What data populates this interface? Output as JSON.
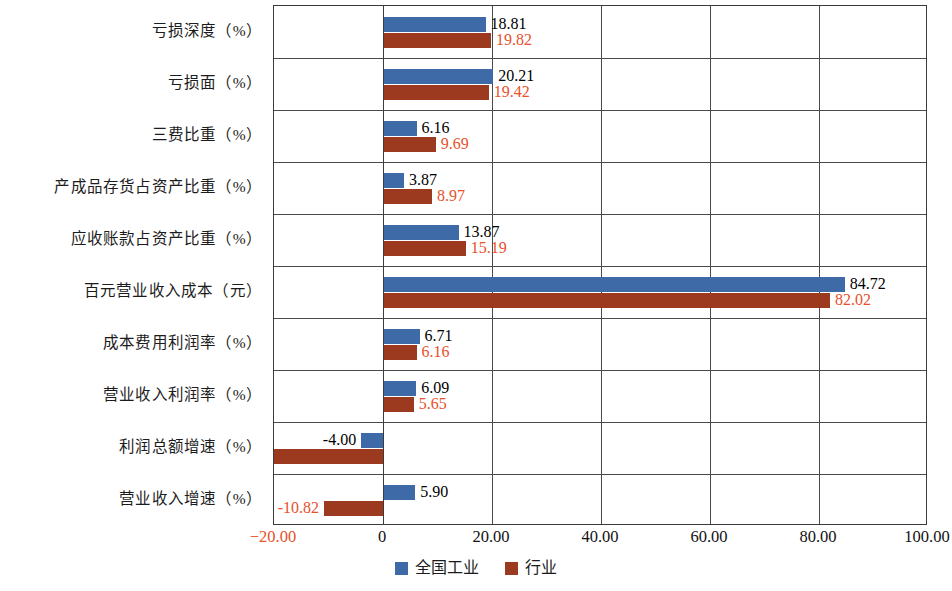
{
  "chart_data": {
    "type": "bar",
    "orientation": "horizontal",
    "title": "",
    "subtitle": "",
    "xlabel": "",
    "ylabel": "",
    "xlim": [
      -20.0,
      100.0
    ],
    "xticks": [
      "-20.00",
      "0",
      "20.00",
      "40.00",
      "60.00",
      "80.00",
      "100.00"
    ],
    "xtick_values": [
      -20,
      0,
      20,
      40,
      60,
      80,
      100
    ],
    "grid": "vertical-and-horizontal",
    "legend_position": "bottom-center",
    "categories": [
      "亏损深度（%）",
      "亏损面（%）",
      "三费比重（%）",
      "产成品存货占资产比重（%）",
      "应收账款占资产比重（%）",
      "百元营业收入成本（元）",
      "成本费用利润率（%）",
      "营业收入利润率（%）",
      "利润总额增速（%）",
      "营业收入增速（%）"
    ],
    "series": [
      {
        "name": "全国工业",
        "color": "#3f6aa8",
        "label_color": "#000000",
        "values": [
          18.81,
          20.21,
          6.16,
          3.87,
          13.87,
          84.72,
          6.71,
          6.09,
          -4.0,
          5.9
        ],
        "labels": [
          "18.81",
          "20.21",
          "6.16",
          "3.87",
          "13.87",
          "84.72",
          "6.71",
          "6.09",
          "-4.00",
          "5.90"
        ]
      },
      {
        "name": "行业",
        "color": "#9c3a1f",
        "label_color": "#e8502a",
        "values": [
          19.82,
          19.42,
          9.69,
          8.97,
          15.19,
          82.02,
          6.16,
          5.65,
          -20.0,
          -10.82
        ],
        "labels": [
          "19.82",
          "19.42",
          "9.69",
          "8.97",
          "15.19",
          "82.02",
          "6.16",
          "5.65",
          "",
          "-10.82"
        ]
      }
    ]
  },
  "legend": {
    "items": [
      {
        "label": "全国工业",
        "color": "#3f6aa8"
      },
      {
        "label": "行业",
        "color": "#9c3a1f"
      }
    ]
  }
}
